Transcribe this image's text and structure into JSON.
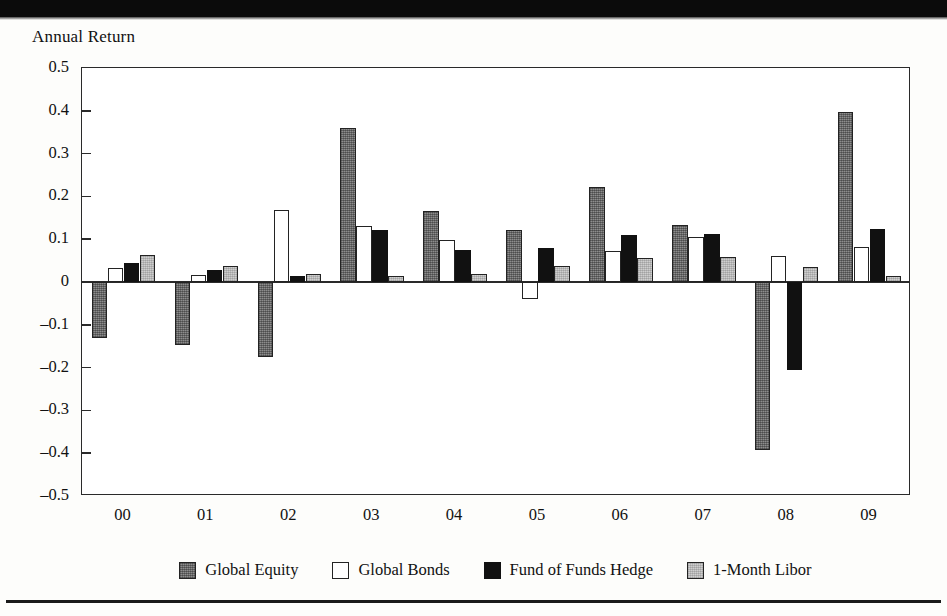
{
  "page": {
    "background_color": "#fdfdfb",
    "rule_color": "#0b0b0b"
  },
  "chart_data": {
    "type": "bar",
    "title": "",
    "ylabel": "Annual Return",
    "xlabel": "",
    "ylim": [
      -0.5,
      0.5
    ],
    "ytick_values": [
      0.5,
      0.4,
      0.3,
      0.2,
      0.1,
      0,
      -0.1,
      -0.2,
      -0.3,
      -0.4,
      -0.5
    ],
    "ytick_labels": [
      "0.5",
      "0.4",
      "0.3",
      "0.2",
      "0.1",
      "0",
      "–0.1",
      "–0.2",
      "–0.3",
      "–0.4",
      "–0.5"
    ],
    "grid": false,
    "legend_position": "bottom",
    "categories": [
      "00",
      "01",
      "02",
      "03",
      "04",
      "05",
      "06",
      "07",
      "08",
      "09"
    ],
    "series": [
      {
        "name": "Global Equity",
        "color": "#8d8d8d",
        "values": [
          -0.131,
          -0.147,
          -0.176,
          0.359,
          0.165,
          0.122,
          0.223,
          0.134,
          -0.392,
          0.397
        ]
      },
      {
        "name": "Global Bonds",
        "color": "#ffffff",
        "values": [
          0.032,
          0.016,
          0.169,
          0.132,
          0.097,
          -0.04,
          0.073,
          0.104,
          0.06,
          0.082
        ]
      },
      {
        "name": "Fund of Funds Hedge",
        "color": "#111111",
        "values": [
          0.045,
          0.028,
          0.015,
          0.121,
          0.074,
          0.08,
          0.11,
          0.112,
          -0.205,
          0.124
        ]
      },
      {
        "name": "1-Month Libor",
        "color": "#cfcfcf",
        "values": [
          0.063,
          0.038,
          0.018,
          0.014,
          0.018,
          0.038,
          0.057,
          0.058,
          0.035,
          0.013
        ]
      }
    ]
  },
  "legend": {
    "items": [
      {
        "label": "Global Equity"
      },
      {
        "label": "Global Bonds"
      },
      {
        "label": "Fund of Funds Hedge"
      },
      {
        "label": "1-Month Libor"
      }
    ]
  }
}
